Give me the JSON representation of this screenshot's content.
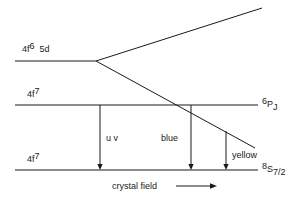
{
  "figure": {
    "type": "energy-level-diagram",
    "background_color": "#ffffff",
    "line_color": "#1a1a1a"
  },
  "levels": {
    "excited_5d": {
      "label_base": "4f",
      "label_sup": "6",
      "label_tail": "5d",
      "label_full": "4f6 5d",
      "y": 61,
      "x_start": 15,
      "x_end": 96
    },
    "middle_4f7": {
      "label_base": "4f",
      "label_sup": "7",
      "label_full": "4f7",
      "right_label_sup": "6",
      "right_label_base": "P",
      "right_label_sub": "J",
      "right_label_full": "6PJ",
      "y": 105,
      "x_start": 15,
      "x_end": 258
    },
    "ground_4f7": {
      "label_base": "4f",
      "label_sup": "7",
      "label_full": "4f7",
      "right_label_sup": "8",
      "right_label_base": "S",
      "right_label_sub": "7/2",
      "right_label_full": "8S7/2",
      "y": 170,
      "x_start": 15,
      "x_end": 258
    }
  },
  "crystal_field_branches": {
    "vertex": {
      "x": 96,
      "y": 61
    },
    "upper": {
      "x": 262,
      "y": 8
    },
    "lower": {
      "x": 255,
      "y": 148
    }
  },
  "transitions": [
    {
      "name": "uv",
      "label": "u v",
      "x": 100,
      "y_start": 105,
      "y_end": 170,
      "label_x": 106,
      "label_y": 141
    },
    {
      "name": "blue",
      "label": "blue",
      "x": 191,
      "y_start": 105,
      "y_end": 170,
      "label_x": 161,
      "label_y": 141
    },
    {
      "name": "yellow",
      "label": "yellow",
      "x": 226,
      "y_start": 131,
      "y_end": 170,
      "label_x": 232,
      "label_y": 158
    }
  ],
  "axis": {
    "label": "crystal field",
    "label_x": 112,
    "label_y": 189,
    "arrow_x_start": 176,
    "arrow_x_end": 217,
    "arrow_y": 186
  },
  "chart_data": {
    "type": "diagram",
    "title": "",
    "energy_levels": [
      {
        "term": "4f6 5d",
        "relative_energy_px": 61,
        "kind": "configuration"
      },
      {
        "term": "4f7 (6PJ)",
        "relative_energy_px": 105,
        "kind": "level"
      },
      {
        "term": "4f7 (8S7/2)",
        "relative_energy_px": 170,
        "kind": "ground-state"
      }
    ],
    "transitions": [
      {
        "label": "u v",
        "from": "6PJ",
        "to": "8S7/2"
      },
      {
        "label": "blue",
        "from": "6PJ",
        "to": "8S7/2"
      },
      {
        "label": "yellow",
        "from": "5d crystal-field-lowered branch",
        "to": "8S7/2"
      }
    ],
    "xlabel": "crystal field",
    "ylabel": "energy"
  }
}
